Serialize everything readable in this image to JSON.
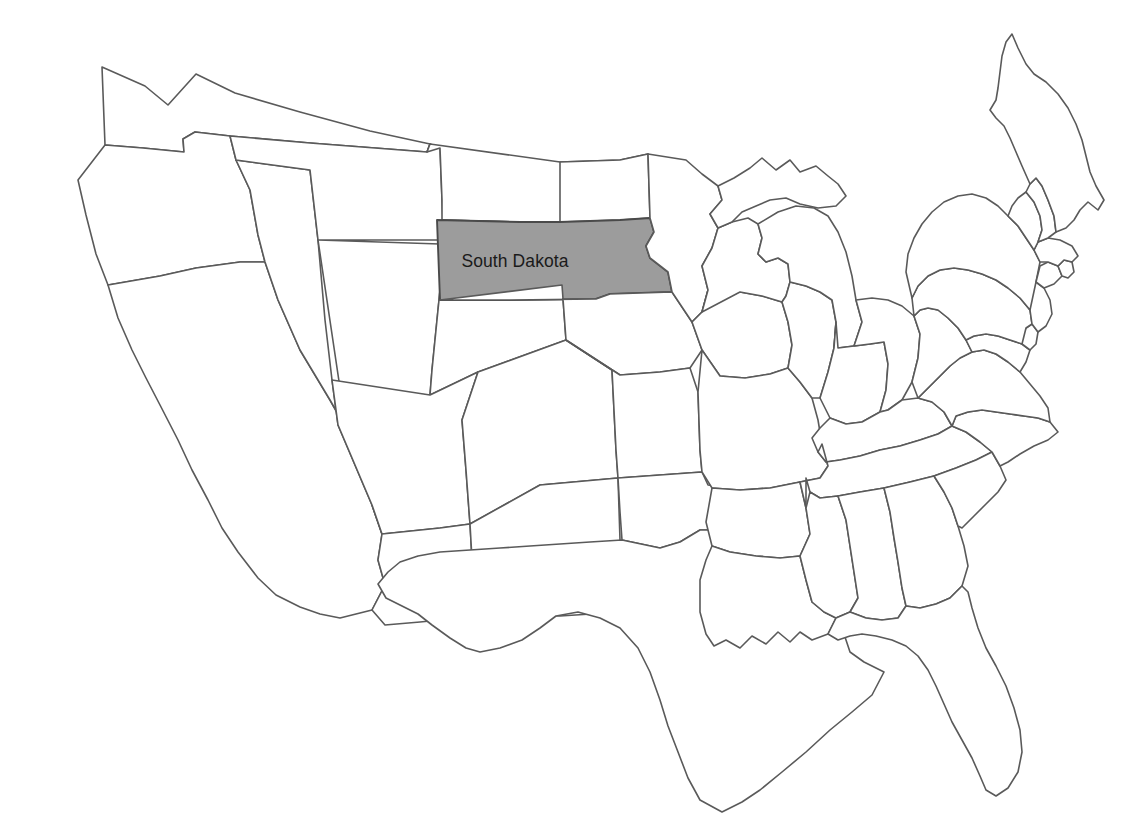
{
  "map": {
    "title": "United States Map",
    "background_color": "#ffffff",
    "border_color": "#5a5a5a",
    "default_fill": "#ffffff",
    "highlight_fill": "#9c9c9c",
    "label_color": "#1a1a1a",
    "highlighted_state": "South Dakota",
    "labels": [
      {
        "id": "south-dakota",
        "text": "South Dakota",
        "x": 515,
        "y": 262
      }
    ],
    "states": [
      {
        "id": "washington",
        "name": "Washington",
        "highlighted": false
      },
      {
        "id": "oregon",
        "name": "Oregon",
        "highlighted": false
      },
      {
        "id": "california",
        "name": "California",
        "highlighted": false
      },
      {
        "id": "nevada",
        "name": "Nevada",
        "highlighted": false
      },
      {
        "id": "idaho",
        "name": "Idaho",
        "highlighted": false
      },
      {
        "id": "montana",
        "name": "Montana",
        "highlighted": false
      },
      {
        "id": "wyoming",
        "name": "Wyoming",
        "highlighted": false
      },
      {
        "id": "utah",
        "name": "Utah",
        "highlighted": false
      },
      {
        "id": "arizona",
        "name": "Arizona",
        "highlighted": false
      },
      {
        "id": "colorado",
        "name": "Colorado",
        "highlighted": false
      },
      {
        "id": "new-mexico",
        "name": "New Mexico",
        "highlighted": false
      },
      {
        "id": "north-dakota",
        "name": "North Dakota",
        "highlighted": false
      },
      {
        "id": "south-dakota",
        "name": "South Dakota",
        "highlighted": true
      },
      {
        "id": "nebraska",
        "name": "Nebraska",
        "highlighted": false
      },
      {
        "id": "kansas",
        "name": "Kansas",
        "highlighted": false
      },
      {
        "id": "oklahoma",
        "name": "Oklahoma",
        "highlighted": false
      },
      {
        "id": "texas",
        "name": "Texas",
        "highlighted": false
      },
      {
        "id": "minnesota",
        "name": "Minnesota",
        "highlighted": false
      },
      {
        "id": "iowa",
        "name": "Iowa",
        "highlighted": false
      },
      {
        "id": "missouri",
        "name": "Missouri",
        "highlighted": false
      },
      {
        "id": "arkansas",
        "name": "Arkansas",
        "highlighted": false
      },
      {
        "id": "louisiana",
        "name": "Louisiana",
        "highlighted": false
      },
      {
        "id": "wisconsin",
        "name": "Wisconsin",
        "highlighted": false
      },
      {
        "id": "illinois",
        "name": "Illinois",
        "highlighted": false
      },
      {
        "id": "michigan-up",
        "name": "Michigan Upper Peninsula",
        "highlighted": false
      },
      {
        "id": "michigan",
        "name": "Michigan",
        "highlighted": false
      },
      {
        "id": "indiana",
        "name": "Indiana",
        "highlighted": false
      },
      {
        "id": "ohio",
        "name": "Ohio",
        "highlighted": false
      },
      {
        "id": "kentucky",
        "name": "Kentucky",
        "highlighted": false
      },
      {
        "id": "tennessee",
        "name": "Tennessee",
        "highlighted": false
      },
      {
        "id": "mississippi",
        "name": "Mississippi",
        "highlighted": false
      },
      {
        "id": "alabama",
        "name": "Alabama",
        "highlighted": false
      },
      {
        "id": "georgia",
        "name": "Georgia",
        "highlighted": false
      },
      {
        "id": "florida",
        "name": "Florida",
        "highlighted": false
      },
      {
        "id": "south-carolina",
        "name": "South Carolina",
        "highlighted": false
      },
      {
        "id": "north-carolina",
        "name": "North Carolina",
        "highlighted": false
      },
      {
        "id": "virginia",
        "name": "Virginia",
        "highlighted": false
      },
      {
        "id": "west-virginia",
        "name": "West Virginia",
        "highlighted": false
      },
      {
        "id": "maryland",
        "name": "Maryland",
        "highlighted": false
      },
      {
        "id": "delaware",
        "name": "Delaware",
        "highlighted": false
      },
      {
        "id": "pennsylvania",
        "name": "Pennsylvania",
        "highlighted": false
      },
      {
        "id": "new-jersey",
        "name": "New Jersey",
        "highlighted": false
      },
      {
        "id": "new-york",
        "name": "New York",
        "highlighted": false
      },
      {
        "id": "connecticut",
        "name": "Connecticut",
        "highlighted": false
      },
      {
        "id": "rhode-island",
        "name": "Rhode Island",
        "highlighted": false
      },
      {
        "id": "massachusetts",
        "name": "Massachusetts",
        "highlighted": false
      },
      {
        "id": "vermont",
        "name": "Vermont",
        "highlighted": false
      },
      {
        "id": "new-hampshire",
        "name": "New Hampshire",
        "highlighted": false
      },
      {
        "id": "maine",
        "name": "Maine",
        "highlighted": false
      }
    ]
  }
}
